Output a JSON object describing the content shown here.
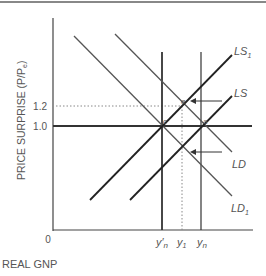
{
  "diagram": {
    "y_axis_label": "PRICE SURPRISE (P/P",
    "y_axis_label_sub": "e",
    "y_axis_label_close": ")",
    "x_axis_label": "REAL GNP",
    "origin_label": "0",
    "y_ticks": [
      {
        "label": "1.2",
        "style": "dotted"
      },
      {
        "label": "1.0",
        "style": "solid"
      }
    ],
    "x_ticks": [
      {
        "label": "y",
        "sub": "n",
        "prime": "′",
        "id": "y-prime-n"
      },
      {
        "label": "y",
        "sub": "1",
        "id": "y1"
      },
      {
        "label": "y",
        "sub": "n",
        "id": "yn"
      }
    ],
    "curves": [
      {
        "id": "LS1",
        "label": "LS",
        "sub": "1",
        "type": "supply"
      },
      {
        "id": "LS",
        "label": "LS",
        "sub": "",
        "type": "supply"
      },
      {
        "id": "LD",
        "label": "LD",
        "sub": "",
        "type": "demand"
      },
      {
        "id": "LD1",
        "label": "LD",
        "sub": "1",
        "type": "demand"
      }
    ],
    "points": [
      {
        "label": "e"
      },
      {
        "label": "c"
      },
      {
        "label": "a"
      }
    ],
    "arrows": [
      {
        "id": "supply-shift-arrow",
        "direction": "left"
      },
      {
        "id": "demand-shift-arrow",
        "direction": "left"
      }
    ],
    "colors": {
      "axis": "#444444",
      "curve": "#333333",
      "text": "#555555",
      "dotted": "#888888"
    }
  }
}
